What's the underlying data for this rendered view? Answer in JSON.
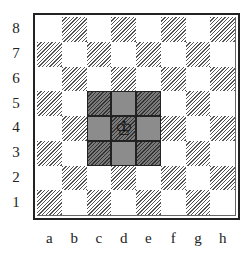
{
  "diagram": {
    "ranks": [
      "8",
      "7",
      "6",
      "5",
      "4",
      "3",
      "2",
      "1"
    ],
    "files": [
      "a",
      "b",
      "c",
      "d",
      "e",
      "f",
      "g",
      "h"
    ],
    "piece": {
      "type": "king",
      "color": "white",
      "square": "d4",
      "glyph": "♔"
    },
    "highlighted_squares": [
      "c5",
      "d5",
      "e5",
      "c4",
      "d4",
      "e4",
      "c3",
      "d3",
      "e3"
    ],
    "colors": {
      "highlight": "#8c8c8c",
      "dark_hatch": "#555555",
      "light": "#ffffff",
      "border": "#222222"
    }
  }
}
